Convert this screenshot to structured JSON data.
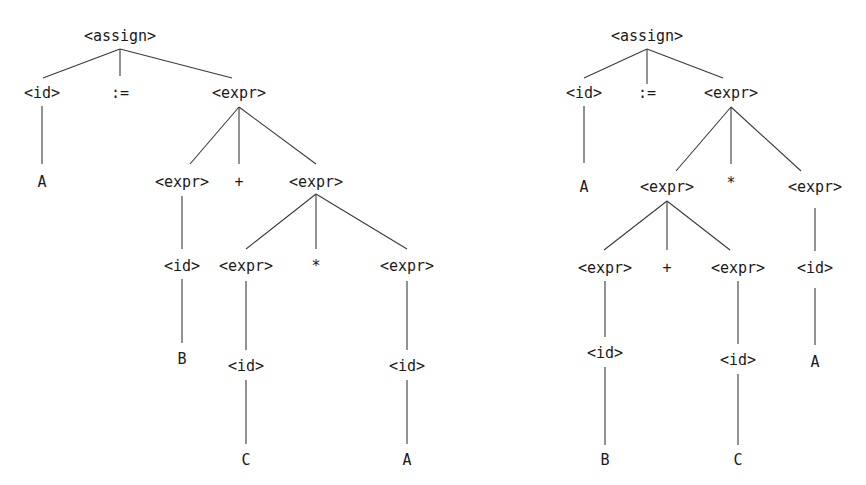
{
  "diagram": {
    "line_color": "#3a3a3a",
    "text_color": "#1a1a1a",
    "trees": [
      {
        "name": "parse-tree-left",
        "nodes": [
          {
            "id": "a",
            "label": "<assign>",
            "x": 120,
            "y": 36
          },
          {
            "id": "id1",
            "label": "<id>",
            "x": 42,
            "y": 93
          },
          {
            "id": "op1",
            "label": ":=",
            "x": 120,
            "y": 93
          },
          {
            "id": "e1",
            "label": "<expr>",
            "x": 239,
            "y": 93
          },
          {
            "id": "A1",
            "label": "A",
            "x": 42,
            "y": 182
          },
          {
            "id": "e2",
            "label": "<expr>",
            "x": 182,
            "y": 182
          },
          {
            "id": "plus",
            "label": "+",
            "x": 239,
            "y": 182
          },
          {
            "id": "e3",
            "label": "<expr>",
            "x": 316,
            "y": 182
          },
          {
            "id": "id2",
            "label": "<id>",
            "x": 182,
            "y": 266
          },
          {
            "id": "e4",
            "label": "<expr>",
            "x": 246,
            "y": 266
          },
          {
            "id": "star",
            "label": "*",
            "x": 316,
            "y": 266
          },
          {
            "id": "e5",
            "label": "<expr>",
            "x": 407,
            "y": 266
          },
          {
            "id": "B",
            "label": "B",
            "x": 182,
            "y": 359
          },
          {
            "id": "id3",
            "label": "<id>",
            "x": 246,
            "y": 366
          },
          {
            "id": "id4",
            "label": "<id>",
            "x": 407,
            "y": 366
          },
          {
            "id": "C",
            "label": "C",
            "x": 246,
            "y": 460
          },
          {
            "id": "A2",
            "label": "A",
            "x": 407,
            "y": 460
          }
        ],
        "edges": [
          {
            "x1": 120,
            "y1": 49,
            "x2": 43,
            "y2": 78
          },
          {
            "x1": 120,
            "y1": 49,
            "x2": 120,
            "y2": 76
          },
          {
            "x1": 120,
            "y1": 49,
            "x2": 232,
            "y2": 78
          },
          {
            "x1": 42,
            "y1": 106,
            "x2": 42,
            "y2": 164
          },
          {
            "x1": 239,
            "y1": 107,
            "x2": 190,
            "y2": 164
          },
          {
            "x1": 239,
            "y1": 107,
            "x2": 239,
            "y2": 164
          },
          {
            "x1": 239,
            "y1": 107,
            "x2": 316,
            "y2": 164
          },
          {
            "x1": 182,
            "y1": 196,
            "x2": 182,
            "y2": 249
          },
          {
            "x1": 316,
            "y1": 194,
            "x2": 246,
            "y2": 249
          },
          {
            "x1": 316,
            "y1": 194,
            "x2": 316,
            "y2": 249
          },
          {
            "x1": 316,
            "y1": 194,
            "x2": 407,
            "y2": 249
          },
          {
            "x1": 182,
            "y1": 279,
            "x2": 182,
            "y2": 343
          },
          {
            "x1": 246,
            "y1": 281,
            "x2": 246,
            "y2": 350
          },
          {
            "x1": 407,
            "y1": 281,
            "x2": 407,
            "y2": 350
          },
          {
            "x1": 246,
            "y1": 380,
            "x2": 246,
            "y2": 444
          },
          {
            "x1": 407,
            "y1": 380,
            "x2": 407,
            "y2": 444
          }
        ]
      },
      {
        "name": "parse-tree-right",
        "nodes": [
          {
            "id": "a",
            "label": "<assign>",
            "x": 647,
            "y": 36
          },
          {
            "id": "id1",
            "label": "<id>",
            "x": 584,
            "y": 93
          },
          {
            "id": "op1",
            "label": ":=",
            "x": 647,
            "y": 93
          },
          {
            "id": "e1",
            "label": "<expr>",
            "x": 731,
            "y": 93
          },
          {
            "id": "A1",
            "label": "A",
            "x": 584,
            "y": 187
          },
          {
            "id": "e2",
            "label": "<expr>",
            "x": 667,
            "y": 187
          },
          {
            "id": "star",
            "label": "*",
            "x": 731,
            "y": 183
          },
          {
            "id": "e3",
            "label": "<expr>",
            "x": 815,
            "y": 187
          },
          {
            "id": "e4",
            "label": "<expr>",
            "x": 605,
            "y": 268
          },
          {
            "id": "plus",
            "label": "+",
            "x": 667,
            "y": 268
          },
          {
            "id": "e5",
            "label": "<expr>",
            "x": 738,
            "y": 268
          },
          {
            "id": "id2",
            "label": "<id>",
            "x": 815,
            "y": 268
          },
          {
            "id": "id3",
            "label": "<id>",
            "x": 605,
            "y": 353
          },
          {
            "id": "id4",
            "label": "<id>",
            "x": 738,
            "y": 360
          },
          {
            "id": "A2",
            "label": "A",
            "x": 815,
            "y": 362
          },
          {
            "id": "B",
            "label": "B",
            "x": 605,
            "y": 460
          },
          {
            "id": "C",
            "label": "C",
            "x": 738,
            "y": 460
          }
        ],
        "edges": [
          {
            "x1": 647,
            "y1": 49,
            "x2": 584,
            "y2": 78
          },
          {
            "x1": 647,
            "y1": 49,
            "x2": 647,
            "y2": 84
          },
          {
            "x1": 647,
            "y1": 49,
            "x2": 723,
            "y2": 78
          },
          {
            "x1": 584,
            "y1": 106,
            "x2": 584,
            "y2": 163
          },
          {
            "x1": 731,
            "y1": 107,
            "x2": 676,
            "y2": 171
          },
          {
            "x1": 731,
            "y1": 107,
            "x2": 731,
            "y2": 164
          },
          {
            "x1": 731,
            "y1": 107,
            "x2": 801,
            "y2": 171
          },
          {
            "x1": 667,
            "y1": 201,
            "x2": 604,
            "y2": 250
          },
          {
            "x1": 667,
            "y1": 201,
            "x2": 667,
            "y2": 250
          },
          {
            "x1": 667,
            "y1": 201,
            "x2": 730,
            "y2": 250
          },
          {
            "x1": 815,
            "y1": 208,
            "x2": 815,
            "y2": 251
          },
          {
            "x1": 605,
            "y1": 281,
            "x2": 605,
            "y2": 337
          },
          {
            "x1": 738,
            "y1": 281,
            "x2": 738,
            "y2": 344
          },
          {
            "x1": 815,
            "y1": 288,
            "x2": 815,
            "y2": 345
          },
          {
            "x1": 605,
            "y1": 367,
            "x2": 605,
            "y2": 445
          },
          {
            "x1": 738,
            "y1": 374,
            "x2": 738,
            "y2": 445
          }
        ]
      }
    ]
  }
}
